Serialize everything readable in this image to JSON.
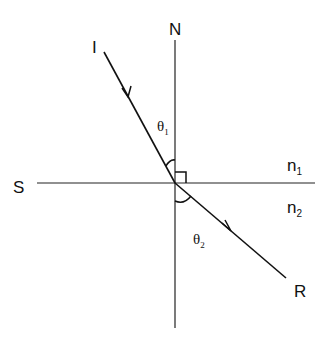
{
  "diagram": {
    "type": "refraction",
    "labels": {
      "normal": "N",
      "surface": "S",
      "incident": "I",
      "refracted": "R",
      "n1": {
        "base": "n",
        "sub": "1"
      },
      "n2": {
        "base": "n",
        "sub": "2"
      },
      "theta1": {
        "base": "θ",
        "sub": "1"
      },
      "theta2": {
        "base": "θ",
        "sub": "2"
      }
    },
    "geometry": {
      "origin": [
        175,
        183
      ],
      "normal_line": [
        [
          175,
          40
        ],
        [
          175,
          328
        ]
      ],
      "surface_line": [
        [
          37,
          183
        ],
        [
          315,
          183
        ]
      ],
      "incident_ray": [
        [
          104,
          52
        ],
        [
          175,
          183
        ]
      ],
      "refracted_ray": [
        [
          175,
          183
        ],
        [
          286,
          278
        ]
      ]
    },
    "line_color": "#111111"
  }
}
